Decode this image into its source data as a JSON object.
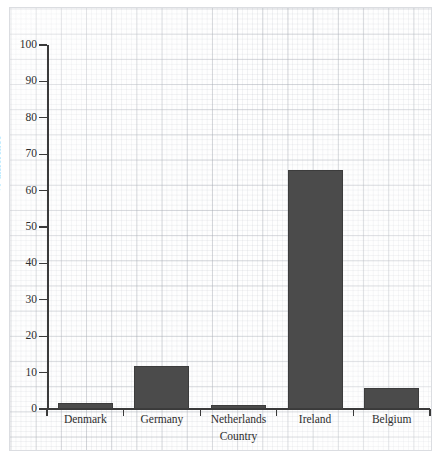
{
  "chart_data": {
    "type": "bar",
    "title": "",
    "subtitle": "",
    "xlabel": "Country",
    "ylabel": "% difference",
    "categories": [
      "Denmark",
      "Germany",
      "Netherlands",
      "Ireland",
      "Belgium"
    ],
    "values": [
      1.7,
      11.9,
      1.1,
      65.7,
      5.7
    ],
    "series": [
      {
        "name": "% difference",
        "values": [
          1.7,
          11.9,
          1.1,
          65.7,
          5.7
        ]
      }
    ],
    "ylim": [
      0,
      100
    ],
    "ytick_labels": [
      "0",
      "10",
      "20",
      "30",
      "40",
      "50",
      "60",
      "70",
      "80",
      "90",
      "100"
    ],
    "ytick_values": [
      0,
      10,
      20,
      30,
      40,
      50,
      60,
      70,
      80,
      90,
      100
    ],
    "grid": true,
    "grid_style": "graph-paper",
    "legend": false,
    "legend_position": "none",
    "bar_color": "#4b4b4b",
    "axis_color": "#3a3a3a",
    "text_color": "#2e2e2e",
    "background_color": "#fefefe"
  }
}
